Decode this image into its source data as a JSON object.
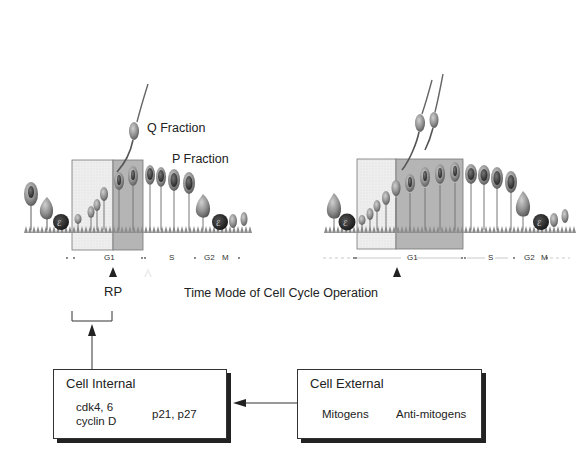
{
  "labels": {
    "q_fraction": "Q Fraction",
    "p_fraction": "P Fraction",
    "rp": "RP",
    "caption": "Time Mode of Cell Cycle Operation"
  },
  "left_panel": {
    "phases": [
      "G1",
      "S",
      "G2",
      "M"
    ]
  },
  "right_panel": {
    "phases": [
      "G1",
      "S",
      "G2",
      "M"
    ]
  },
  "cell_internal": {
    "title": "Cell Internal",
    "items": [
      "cdk4, 6",
      "cyclin D",
      "p21, p27"
    ]
  },
  "cell_external": {
    "title": "Cell External",
    "items": [
      "Mitogens",
      "Anti-mitogens"
    ]
  },
  "colors": {
    "light_region": "#ececec",
    "dark_region": "#b4b4b4",
    "cell_body": "#8a8a8a",
    "nucleus": "#3a3a3a",
    "line": "#333333"
  }
}
